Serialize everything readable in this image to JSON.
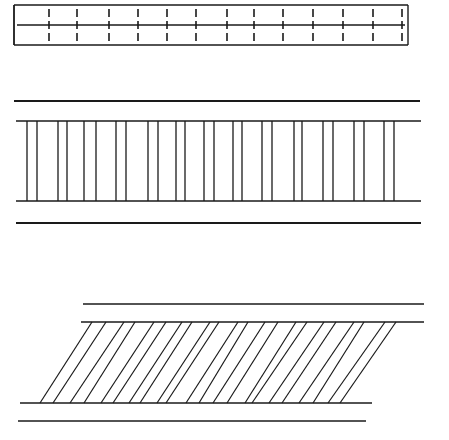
{
  "figure": {
    "ink_color": "#1a1a1a",
    "background": "#ffffff"
  },
  "ruler_strip": {
    "box": {
      "x1": 14,
      "y1": 5,
      "x2": 408,
      "y2": 45
    },
    "center_line_y": 25,
    "tick_x": [
      49,
      77,
      109,
      138,
      167,
      196,
      227,
      254,
      283,
      313,
      343,
      373,
      402
    ],
    "tick_segments": [
      [
        9,
        17
      ],
      [
        21,
        29
      ],
      [
        33,
        41
      ]
    ]
  },
  "vertical_band": {
    "outer_top": {
      "x1": 14,
      "x2": 420,
      "y": 101
    },
    "rail_top": {
      "x1": 16,
      "x2": 421,
      "y": 121
    },
    "rail_bottom": {
      "x1": 16,
      "x2": 421,
      "y": 201
    },
    "outer_bottom": {
      "x1": 16,
      "x2": 421,
      "y": 223
    },
    "bar_x": [
      27,
      37,
      58,
      67,
      84,
      96,
      116,
      126,
      148,
      158,
      176,
      185,
      204,
      214,
      233,
      242,
      262,
      272,
      294,
      302,
      323,
      333,
      354,
      364,
      384,
      394
    ]
  },
  "diagonal_band": {
    "outer_top": {
      "x1": 83,
      "x2": 424,
      "y": 304
    },
    "rail_top": {
      "x1": 81,
      "x2": 424,
      "y": 322
    },
    "rail_bottom": {
      "x1": 20,
      "x2": 372,
      "y": 403
    },
    "outer_bottom": {
      "x1": 18,
      "x2": 366,
      "y": 421
    },
    "bar_bottom_x": [
      40,
      53,
      70,
      84,
      101,
      113,
      129,
      140,
      157,
      166,
      186,
      199,
      213,
      227,
      245,
      252,
      269,
      282,
      299,
      313,
      328,
      340
    ],
    "bar_top_x": [
      92,
      106,
      124,
      135,
      154,
      166,
      182,
      192,
      210,
      219,
      238,
      248,
      265,
      278,
      296,
      307,
      324,
      336,
      354,
      364,
      385,
      396
    ]
  }
}
